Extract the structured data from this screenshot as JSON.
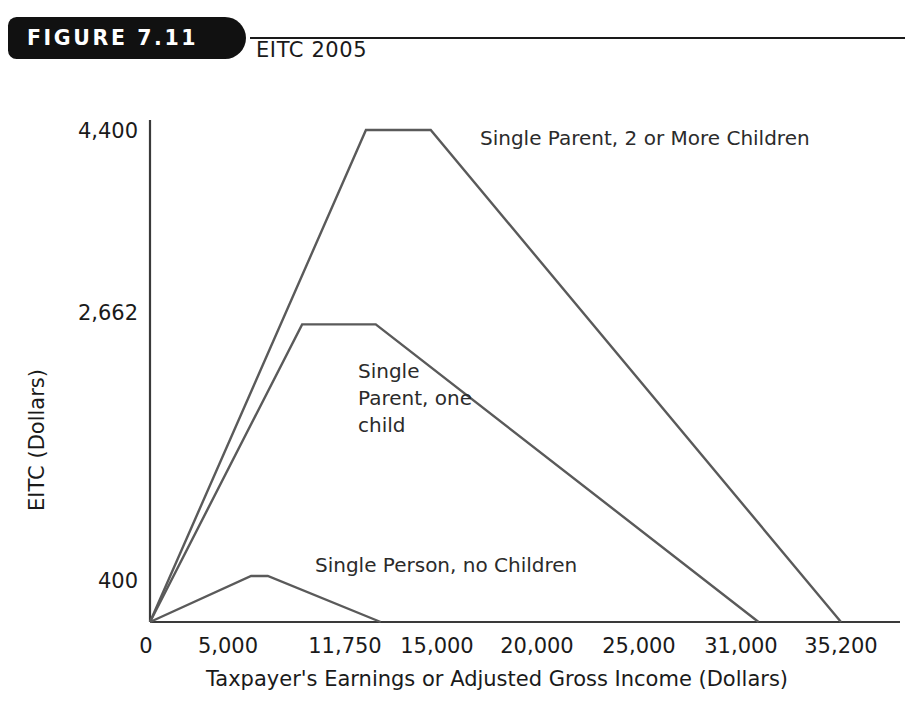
{
  "header": {
    "badge": "FIGURE 7.11",
    "title": "EITC 2005"
  },
  "chart_data": {
    "type": "line",
    "title": "EITC 2005",
    "xlabel": "Taxpayer's Earnings or Adjusted Gross Income (Dollars)",
    "ylabel": "EITC (Dollars)",
    "xlim": [
      0,
      38000
    ],
    "ylim": [
      0,
      4800
    ],
    "grid": false,
    "legend": "inline-annotations",
    "xticks": [
      0,
      5000,
      11750,
      15000,
      20000,
      25000,
      31000,
      35200
    ],
    "xticklabels": [
      "0",
      "5,000",
      "11,750",
      "15,000",
      "20,000",
      "25,000",
      "31,000",
      "35,200"
    ],
    "yticks": [
      0,
      400,
      2662,
      4400
    ],
    "yticklabels": [
      "0",
      "400",
      "2,662",
      "4,400"
    ],
    "series": [
      {
        "name": "Single Parent, 2 or More Children",
        "x": [
          0,
          11000,
          14300,
          35200
        ],
        "y": [
          0,
          4400,
          4400,
          0
        ],
        "color": "#5a5a5a"
      },
      {
        "name": "Single Parent, one child",
        "x": [
          0,
          7750,
          11500,
          31000
        ],
        "y": [
          0,
          2662,
          2662,
          0
        ],
        "color": "#5a5a5a"
      },
      {
        "name": "Single Person, no Children",
        "x": [
          0,
          5150,
          6000,
          11750
        ],
        "y": [
          0,
          412,
          412,
          0
        ],
        "color": "#5a5a5a"
      }
    ],
    "annotations": [
      {
        "text": "Single Parent, 2 or More Children",
        "x": 480,
        "y": 65
      },
      {
        "text_lines": [
          "Single",
          "Parent, one",
          "child"
        ],
        "x": 358,
        "y": 298
      },
      {
        "text": "Single Person, no Children",
        "x": 315,
        "y": 492
      }
    ]
  },
  "axis_style": {
    "line_color": "#5a5a5a",
    "axis_color": "#3a3a3a",
    "line_width": 2.4
  }
}
